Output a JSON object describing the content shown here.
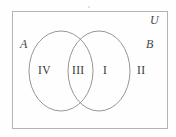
{
  "figure": {
    "kind": "venn-diagram",
    "sets": 2,
    "universal_label": "U",
    "set_a_label": "A",
    "set_b_label": "B",
    "stroke_color": "#8a8a8a",
    "rect_stroke_color": "#b3b3b3",
    "text_color": "#363636",
    "background_color": "#fefefe"
  },
  "regions": [
    {
      "id": "a-only",
      "label": "IV"
    },
    {
      "id": "intersection",
      "label": "III"
    },
    {
      "id": "b-only",
      "label": "I"
    },
    {
      "id": "outside",
      "label": "II"
    }
  ]
}
